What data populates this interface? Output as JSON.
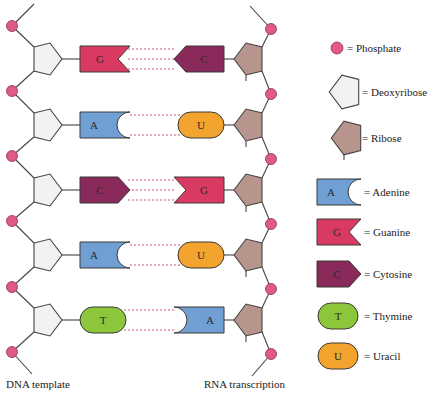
{
  "colors": {
    "phosphate": "#e05a86",
    "deoxyribose": "#f2f2f0",
    "ribose": "#b8958c",
    "adenine": "#6f9fd3",
    "guanine": "#d83a62",
    "cytosine": "#8a2a5a",
    "thymine": "#8cc63a",
    "uracil": "#f3a42e",
    "hbond": "#e0507a",
    "line": "#444444"
  },
  "rows": [
    {
      "dna": "G",
      "rna": "C"
    },
    {
      "dna": "A",
      "rna": "U"
    },
    {
      "dna": "C",
      "rna": "G"
    },
    {
      "dna": "A",
      "rna": "U"
    },
    {
      "dna": "T",
      "rna": "A"
    }
  ],
  "legend": [
    {
      "shape": "phosphate",
      "label": "= Phosphate"
    },
    {
      "shape": "deoxyribose",
      "label": "= Deoxyribose"
    },
    {
      "shape": "ribose",
      "label": "= Ribose"
    },
    {
      "shape": "adenine",
      "letter": "A",
      "label": "= Adenine"
    },
    {
      "shape": "guanine",
      "letter": "G",
      "label": "= Guanine"
    },
    {
      "shape": "cytosine",
      "letter": "C",
      "label": "= Cytosine"
    },
    {
      "shape": "thymine",
      "letter": "T",
      "label": "= Thymine"
    },
    {
      "shape": "uracil",
      "letter": "U",
      "label": "= Uracil"
    }
  ],
  "captions": {
    "left": "DNA template",
    "right": "RNA transcription"
  }
}
